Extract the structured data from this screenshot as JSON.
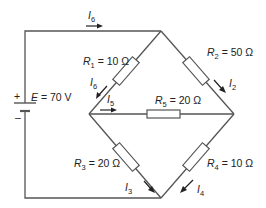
{
  "diagram": {
    "type": "circuit-schematic",
    "source": {
      "symbol": "E",
      "value": "70 V",
      "label": "E = 70 V",
      "plus": "+",
      "minus": "–"
    },
    "resistors": [
      {
        "name": "R",
        "sub": "1",
        "value": "10 Ω",
        "eq": " = 10 Ω"
      },
      {
        "name": "R",
        "sub": "2",
        "value": "50 Ω",
        "eq": " = 50 Ω"
      },
      {
        "name": "R",
        "sub": "3",
        "value": "20 Ω",
        "eq": " = 20 Ω"
      },
      {
        "name": "R",
        "sub": "4",
        "value": "10 Ω",
        "eq": " = 10 Ω"
      },
      {
        "name": "R",
        "sub": "5",
        "value": "20 Ω",
        "eq": " = 20 Ω"
      }
    ],
    "currents": [
      {
        "name": "I",
        "sub": "6",
        "location": "top wire"
      },
      {
        "name": "I",
        "sub": "6",
        "location": "R1 branch (upper-left)"
      },
      {
        "name": "I",
        "sub": "2",
        "location": "R2 branch"
      },
      {
        "name": "I",
        "sub": "5",
        "location": "R5 bridge"
      },
      {
        "name": "I",
        "sub": "3",
        "location": "R3 branch"
      },
      {
        "name": "I",
        "sub": "4",
        "location": "R4 branch"
      }
    ],
    "colors": {
      "wire": "#555555",
      "text": "#222222",
      "background": "#ffffff"
    }
  }
}
